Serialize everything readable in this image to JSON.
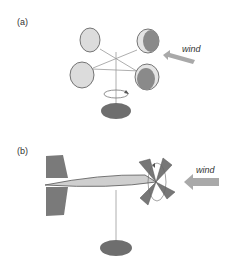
{
  "panels": [
    {
      "label": "(a)",
      "wind_label": "wind",
      "description": "cup anemometer"
    },
    {
      "label": "(b)",
      "wind_label": "wind",
      "description": "propeller anemometer with vane"
    }
  ],
  "colors": {
    "cup_light": "#d8d8d8",
    "cup_dark": "#8a8a8a",
    "base": "#6e6e6e",
    "arrow": "#a9a9a9",
    "tail": "#7a7a7a",
    "body": "#cfcfcf",
    "stroke": "#555555"
  }
}
